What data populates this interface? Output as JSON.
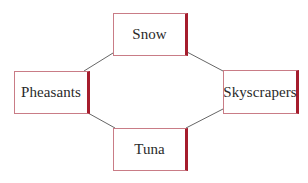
{
  "diagram": {
    "type": "cycle",
    "colors": {
      "box_border": "#c97c86",
      "box_accent_bar": "#a51d2d",
      "connector": "#555555",
      "text": "#2a2a2a"
    },
    "nodes": [
      {
        "id": "snow",
        "label": "Snow",
        "position": "top"
      },
      {
        "id": "pheasants",
        "label": "Pheasants",
        "position": "left"
      },
      {
        "id": "skyscrapers",
        "label": "Skyscrapers",
        "position": "right"
      },
      {
        "id": "tuna",
        "label": "Tuna",
        "position": "bottom"
      }
    ],
    "edges": [
      {
        "from": "pheasants",
        "to": "snow"
      },
      {
        "from": "snow",
        "to": "skyscrapers"
      },
      {
        "from": "skyscrapers",
        "to": "tuna"
      },
      {
        "from": "tuna",
        "to": "pheasants"
      }
    ]
  }
}
